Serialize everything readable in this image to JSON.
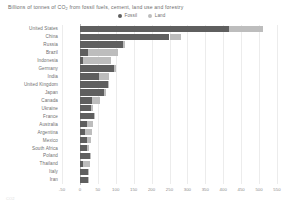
{
  "title": {
    "prefix": "Billions of tonnes of CO",
    "sub": "2",
    "suffix": " from fossil fuels, cement, land use and forestry",
    "full": "Billions of tonnes of CO2 from fossil fuels, cement, land use and forestry"
  },
  "legend": {
    "position": "top-center",
    "items": [
      {
        "label": "Fossil",
        "color": "#5f5f5f",
        "marker": "filled-circle"
      },
      {
        "label": "Land",
        "color": "#bdbdbd",
        "marker": "filled-circle"
      }
    ]
  },
  "source_note": "CO2",
  "chart_data": {
    "type": "bar",
    "orientation": "horizontal",
    "stacked": true,
    "title": "Billions of tonnes of CO2 from fossil fuels, cement, land use and forestry",
    "xlabel": "",
    "ylabel": "",
    "xlim": [
      -50,
      550
    ],
    "grid": true,
    "grid_axis": "x",
    "legend_position": "top-center",
    "xticks": [
      -50,
      0,
      50,
      100,
      150,
      200,
      250,
      300,
      350,
      400,
      450,
      500,
      550
    ],
    "xticklabels": [
      "-50",
      "0",
      "50",
      "100",
      "150",
      "200",
      "250",
      "300",
      "350",
      "400",
      "450",
      "500",
      "550"
    ],
    "categories": [
      "United States",
      "China",
      "Russia",
      "Brazil",
      "Indonesia",
      "Germany",
      "India",
      "United Kingdom",
      "Japan",
      "Canada",
      "Ukraine",
      "France",
      "Australia",
      "Argentina",
      "Mexico",
      "South Africa",
      "Poland",
      "Thailand",
      "Italy",
      "Iran"
    ],
    "series": [
      {
        "name": "Fossil",
        "color": "#5f5f5f",
        "values": [
          417,
          250,
          119,
          22,
          9,
          95,
          54,
          79,
          67,
          34,
          30,
          39,
          20,
          13,
          20,
          19,
          29,
          9,
          22,
          22
        ]
      },
      {
        "name": "Land",
        "color": "#bdbdbd",
        "values": [
          93,
          33,
          7,
          84,
          78,
          5,
          27,
          3,
          5,
          22,
          6,
          2,
          17,
          20,
          12,
          7,
          1,
          18,
          3,
          3
        ]
      }
    ],
    "totals": [
      510,
      283,
      126,
      106,
      87,
      100,
      81,
      82,
      72,
      56,
      36,
      41,
      37,
      33,
      32,
      26,
      30,
      27,
      25,
      25
    ]
  }
}
